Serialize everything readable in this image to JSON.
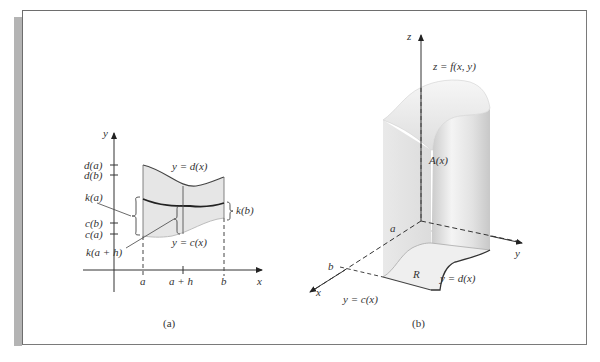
{
  "panel_a": {
    "caption": "(a)",
    "axis_y_label": "y",
    "axis_x_label": "x",
    "tick_labels_y": [
      "d(a)",
      "d(b)",
      "k(a)",
      "c(b)",
      "c(a)"
    ],
    "label_k_ah": "k(a + h)",
    "label_k_b": "k(b)",
    "curve_top_label": "y = d(x)",
    "curve_bottom_label": "y = c(x)",
    "x_ticks": [
      "a",
      "a + h",
      "b"
    ]
  },
  "panel_b": {
    "caption": "(b)",
    "axis_z_label": "z",
    "axis_x_label": "x",
    "axis_y_label": "y",
    "surface_label": "z = f(x, y)",
    "area_label": "A(x)",
    "region_label": "R",
    "x_marks": [
      "a",
      "b"
    ],
    "curve_d_label": "y = d(x)",
    "curve_c_label": "y = c(x)"
  },
  "colors": {
    "region_fill": "#e6e6e6",
    "axis": "#333333",
    "frame": "#6e6e6e",
    "stripe": "#b4b4b4"
  }
}
